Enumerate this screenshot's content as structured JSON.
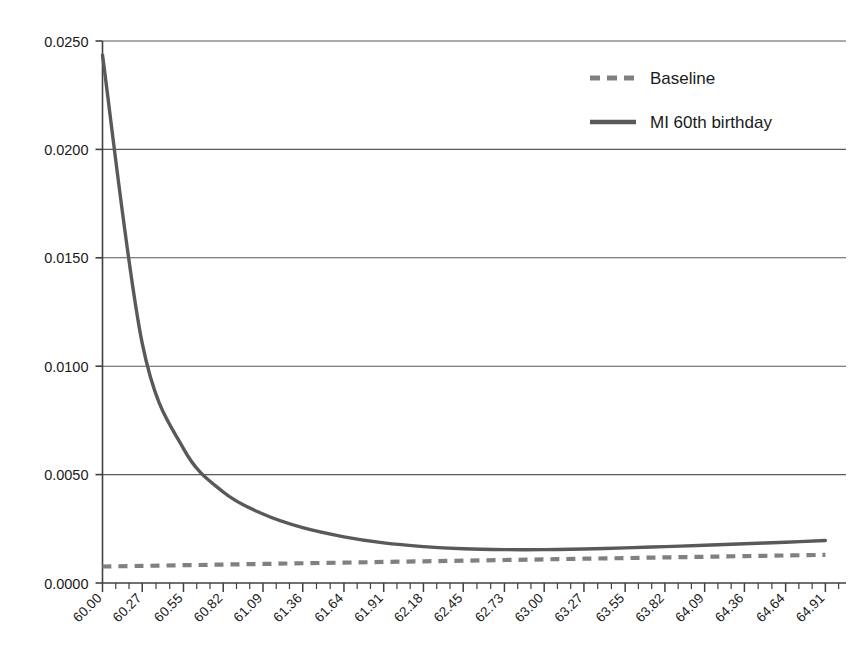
{
  "chart_data": {
    "type": "line",
    "title": "",
    "subtitle": "",
    "xlabel": "",
    "ylabel": "",
    "grid": true,
    "legend_position": "top-right",
    "xlim": [
      60.0,
      65.05
    ],
    "ylim": [
      0.0,
      0.025
    ],
    "ytick_labels": [
      "0.0250",
      "0.0200",
      "0.0150",
      "0.0100",
      "0.0050",
      "0.0000"
    ],
    "ytick_values": [
      0.025,
      0.02,
      0.015,
      0.01,
      0.005,
      0.0
    ],
    "categories": [
      "60.00",
      "60.27",
      "60.55",
      "60.82",
      "61.09",
      "61.36",
      "61.64",
      "61.91",
      "62.18",
      "62.45",
      "62.73",
      "63.00",
      "63.27",
      "63.55",
      "63.82",
      "64.09",
      "64.36",
      "64.64",
      "64.91"
    ],
    "x": [
      60.0,
      60.27,
      60.55,
      60.82,
      61.09,
      61.36,
      61.64,
      61.91,
      62.18,
      62.45,
      62.73,
      63.0,
      63.27,
      63.55,
      63.82,
      64.09,
      64.36,
      64.64,
      64.91
    ],
    "minor_ticks_per_interval": 2,
    "series": [
      {
        "name": "Baseline",
        "style": "dashed",
        "color": "#808080",
        "values": [
          0.00076,
          0.00079,
          0.00082,
          0.00085,
          0.00088,
          0.00091,
          0.00094,
          0.00097,
          0.001,
          0.00103,
          0.00106,
          0.00109,
          0.00112,
          0.00115,
          0.00118,
          0.00121,
          0.00124,
          0.00127,
          0.0013
        ]
      },
      {
        "name": "MI 60th birthday",
        "style": "solid",
        "color": "#595959",
        "values": [
          0.02435,
          0.01105,
          0.0062,
          0.0042,
          0.00318,
          0.00255,
          0.00213,
          0.00185,
          0.00168,
          0.00158,
          0.00154,
          0.00154,
          0.00157,
          0.00162,
          0.00168,
          0.00174,
          0.00181,
          0.00188,
          0.00196
        ]
      }
    ]
  },
  "legend": {
    "items": [
      {
        "label": "Baseline",
        "style": "dashed",
        "color": "#808080"
      },
      {
        "label": "MI 60th birthday",
        "style": "solid",
        "color": "#595959"
      }
    ]
  },
  "axes": {
    "axis_color": "#404040",
    "grid_color": "#595959"
  }
}
